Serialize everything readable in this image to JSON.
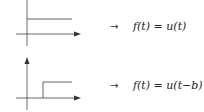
{
  "diagrams": [
    {
      "name": "unit-step",
      "mapping_arrow": "→",
      "equation": "f(t) = u(t)"
    },
    {
      "name": "shifted-unit-step",
      "mapping_arrow": "→",
      "equation": "f(t) = u(t−b)"
    }
  ],
  "colors": {
    "axis": "#444444",
    "step": "#555555"
  }
}
